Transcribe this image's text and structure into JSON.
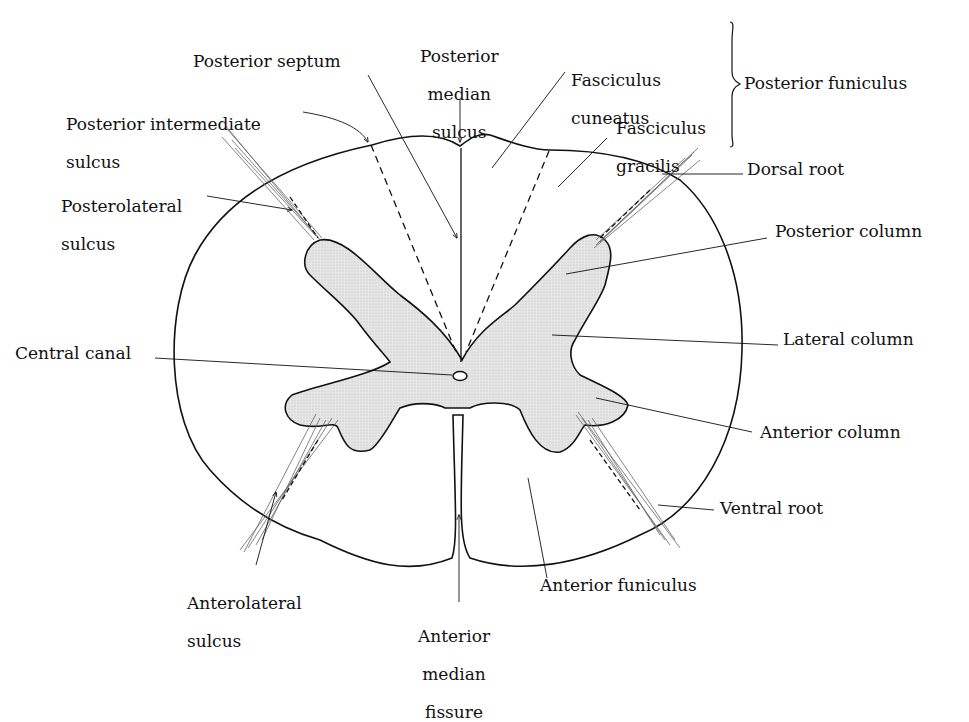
{
  "colors": {
    "outline": "#111111",
    "gray_matter": "#e2e2e2",
    "background": "#ffffff",
    "root_fibers": "#777777"
  },
  "labels": {
    "posterior_septum": "Posterior septum",
    "posterior_median_sulcus": [
      "Posterior",
      "median",
      "sulcus"
    ],
    "fasciculus_cuneatus": [
      "Fasciculus",
      "cuneatus"
    ],
    "fasciculus_gracilis": [
      "Fasciculus",
      "gracilis"
    ],
    "posterior_funiculus": "Posterior funiculus",
    "posterior_intermediate_sulcus": [
      "Posterior intermediate",
      "sulcus"
    ],
    "posterolateral_sulcus": [
      "Posterolateral",
      "sulcus"
    ],
    "dorsal_root": "Dorsal root",
    "posterior_column": "Posterior column",
    "central_canal": "Central canal",
    "lateral_column": "Lateral column",
    "anterior_column": "Anterior column",
    "ventral_root": "Ventral root",
    "anterolateral_sulcus": [
      "Anterolateral",
      "sulcus"
    ],
    "anterior_funiculus": "Anterior funiculus",
    "anterior_median_fissure": [
      "Anterior",
      "median",
      "fissure"
    ]
  }
}
